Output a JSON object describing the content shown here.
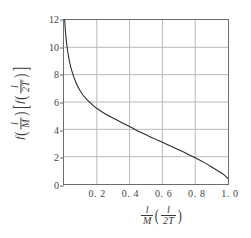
{
  "chart_data": {
    "type": "line",
    "title": "",
    "xlabel": "(l/M)(l/2T)",
    "ylabel": "f(l/M)[f(l/2T)]",
    "xlim": [
      0,
      1.0
    ],
    "ylim": [
      0,
      12
    ],
    "grid": true,
    "legend": null,
    "xticks": [
      0.2,
      0.4,
      0.6,
      0.8,
      1.0
    ],
    "xtick_labels": [
      "0. 2",
      "0. 4",
      "0. 6",
      "0. 8",
      "1. 0"
    ],
    "yticks": [
      0,
      2,
      4,
      6,
      8,
      10,
      12
    ],
    "ytick_labels": [
      "0",
      "2",
      "4",
      "6",
      "8",
      "10",
      "12"
    ],
    "series": [
      {
        "name": "f",
        "color": "#2b2b2b",
        "x": [
          0.004,
          0.01,
          0.018,
          0.028,
          0.04,
          0.055,
          0.072,
          0.09,
          0.11,
          0.13,
          0.155,
          0.18,
          0.21,
          0.24,
          0.275,
          0.31,
          0.35,
          0.4,
          0.45,
          0.5,
          0.55,
          0.6,
          0.65,
          0.7,
          0.75,
          0.8,
          0.85,
          0.9,
          0.94,
          0.97,
          1.0
        ],
        "y": [
          12.0,
          11.0,
          10.1,
          9.3,
          8.6,
          8.0,
          7.45,
          7.0,
          6.6,
          6.3,
          6.0,
          5.72,
          5.45,
          5.22,
          4.98,
          4.75,
          4.5,
          4.2,
          3.88,
          3.6,
          3.32,
          3.05,
          2.78,
          2.5,
          2.22,
          1.92,
          1.6,
          1.25,
          0.95,
          0.72,
          0.4
        ]
      }
    ]
  },
  "axis": {
    "y_title_parts": {
      "f1": "f",
      "num1": "l",
      "den1": "M",
      "f2": "f",
      "num2": "l",
      "den2": "2T"
    },
    "x_title_parts": {
      "num1": "l",
      "den1": "M",
      "num2": "l",
      "den2": "2T"
    }
  },
  "style": {
    "axis_color": "#6d6d6d",
    "grid_color": "#b8b8b8",
    "curve_color": "#2b2b2b",
    "text_color": "#3a3a3a",
    "background": "#ffffff"
  }
}
